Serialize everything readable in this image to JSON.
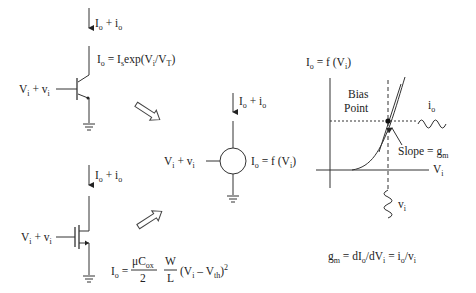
{
  "bjt": {
    "current_label": {
      "main": "I",
      "sub1": "o",
      "plus": " + i",
      "sub2": "o"
    },
    "equation": {
      "p1": "I",
      "s1": "o",
      "p2": " = I",
      "s2": "s",
      "p3": "exp(V",
      "s3": "i",
      "p4": "/V",
      "s4": "T",
      "p5": ")"
    },
    "input_label": {
      "p1": "V",
      "s1": "i",
      "p2": " + v",
      "s2": "i"
    }
  },
  "mosfet": {
    "current_label": {
      "main": "I",
      "sub1": "o",
      "plus": " + i",
      "sub2": "o"
    },
    "input_label": {
      "p1": "V",
      "s1": "i",
      "p2": " + v",
      "s2": "i"
    },
    "equation": {
      "lhs": "I",
      "lhs_sub": "o",
      "eq": "=",
      "frac1_num": "μC",
      "frac1_num_sub": "ox",
      "frac1_den": "2",
      "frac2_num": "W",
      "frac2_den": "L",
      "p1": "(V",
      "s1": "i",
      "p2": " – V",
      "s2": "th",
      "p3": ")",
      "sup": "2"
    }
  },
  "generic": {
    "current_label": {
      "main": "I",
      "sub1": "o",
      "plus": " + i",
      "sub2": "o"
    },
    "input_label": {
      "p1": "V",
      "s1": "i",
      "p2": " + v",
      "s2": "i"
    },
    "equation": {
      "p1": "I",
      "s1": "o",
      "p2": " = f (V",
      "s2": "i",
      "p3": ")"
    }
  },
  "graph": {
    "y_label": {
      "p1": "I",
      "s1": "o",
      "p2": " = f (V",
      "s2": "i",
      "p3": ")"
    },
    "x_label": {
      "p1": "V",
      "s1": "i"
    },
    "bias_point_line1": "Bias",
    "bias_point_line2": "Point",
    "output_signal": {
      "p1": "i",
      "s1": "o"
    },
    "input_signal": {
      "p1": "v",
      "s1": "i"
    },
    "slope_label": {
      "p1": "Slope = g",
      "s1": "m"
    }
  },
  "transconductance": {
    "p1": "g",
    "s1": "m",
    "p2": " = dI",
    "s2": "o",
    "p3": "/dV",
    "s3": "i",
    "p4": " = i",
    "s4": "o",
    "p5": "/v",
    "s5": "i"
  }
}
